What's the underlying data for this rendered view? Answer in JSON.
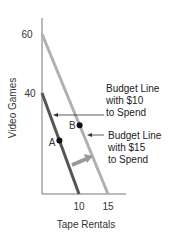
{
  "chart_data": {
    "type": "line",
    "title": "",
    "xlabel": "Tape Rentals",
    "ylabel": "Video Games",
    "x_ticks": [
      "10",
      "15"
    ],
    "y_ticks": [
      "40",
      "60"
    ],
    "series": [
      {
        "name": "Budget Line with $10 to Spend",
        "color": "#555555",
        "points": [
          {
            "x": 0,
            "y": 40
          },
          {
            "x": 10,
            "y": 0
          }
        ]
      },
      {
        "name": "Budget Line with $15 to Spend",
        "color": "#b0b0b0",
        "points": [
          {
            "x": 0,
            "y": 60
          },
          {
            "x": 15,
            "y": 0
          }
        ]
      }
    ],
    "points": [
      {
        "label": "A",
        "series": 0,
        "t": 0.47
      },
      {
        "label": "B",
        "series": 1,
        "t": 0.57
      }
    ],
    "annotations": [
      {
        "lines": [
          "Budget Line",
          "with $10",
          "to Spend"
        ],
        "points_to": "Budget Line with $10 to Spend"
      },
      {
        "lines": [
          "Budget Line",
          "with $15",
          "to Spend"
        ],
        "points_to": "Budget Line with $15 to Spend"
      }
    ],
    "shift_arrow": {
      "description": "outward shift of budget line",
      "color": "#999999"
    },
    "grid": false,
    "legend": "none"
  }
}
